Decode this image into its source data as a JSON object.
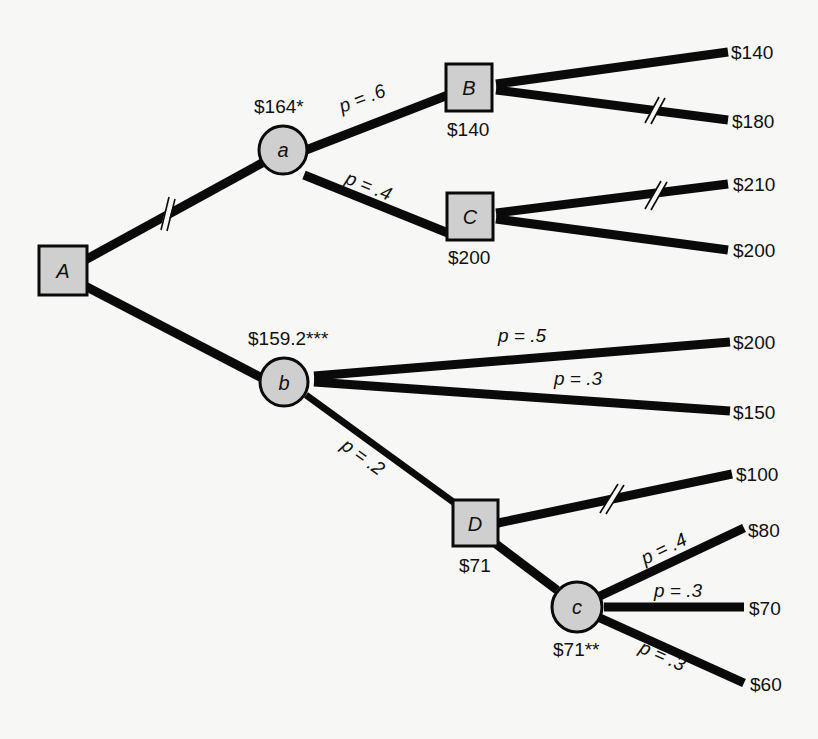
{
  "diagram": {
    "type": "decision-tree",
    "nodes": {
      "A": {
        "letter": "A",
        "kind": "decision"
      },
      "a": {
        "letter": "a",
        "kind": "chance",
        "value": "$164*"
      },
      "B": {
        "letter": "B",
        "kind": "decision",
        "value": "$140"
      },
      "C": {
        "letter": "C",
        "kind": "decision",
        "value": "$200"
      },
      "b": {
        "letter": "b",
        "kind": "chance",
        "value": "$159.2***"
      },
      "D": {
        "letter": "D",
        "kind": "decision",
        "value": "$71"
      },
      "c": {
        "letter": "c",
        "kind": "chance",
        "value": "$71**"
      }
    },
    "probabilities": {
      "a_to_B": "p = .6",
      "a_to_C": "p = .4",
      "b_to_200": "p = .5",
      "b_to_150": "p = .3",
      "b_to_D": "p = .2",
      "c_to_80": "p = .4",
      "c_to_70": "p = .3",
      "c_to_60": "p = .3"
    },
    "payoffs": {
      "B_top": "$140",
      "B_bottom": "$180",
      "C_top": "$210",
      "C_bottom": "$200",
      "b_top": "$200",
      "b_mid": "$150",
      "D_top": "$100",
      "c_top": "$80",
      "c_mid": "$70",
      "c_bottom": "$60"
    },
    "pruned_branches": [
      "A_to_a",
      "B_to_180",
      "C_to_210",
      "D_to_100"
    ]
  }
}
